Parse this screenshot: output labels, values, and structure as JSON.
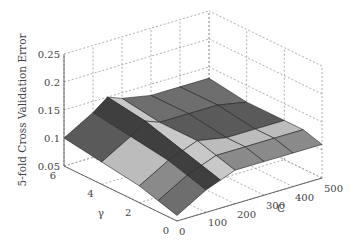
{
  "chart_data": {
    "type": "surface3d",
    "title": "",
    "xlabel": "C",
    "ylabel": "γ",
    "zlabel": "5-fold Cross Validation Error",
    "x_ticks": [
      "0",
      "100",
      "200",
      "300",
      "400",
      "500"
    ],
    "y_ticks": [
      "0",
      "2",
      "4",
      "6"
    ],
    "z_ticks": [
      "0.05",
      "0.1",
      "0.15",
      "0.2",
      "0.25"
    ],
    "xlim": [
      0,
      500
    ],
    "ylim": [
      0,
      6
    ],
    "zlim": [
      0.05,
      0.25
    ],
    "grid": true,
    "legend": null,
    "colormap": "grayscale",
    "surface": {
      "C": [
        0,
        100,
        150,
        200,
        300,
        400,
        500
      ],
      "gamma": [
        0,
        1,
        2,
        4,
        6
      ],
      "error": [
        [
          0.06,
          0.07,
          0.08,
          0.09,
          0.1
        ],
        [
          0.09,
          0.1,
          0.11,
          0.12,
          0.13
        ],
        [
          0.1,
          0.11,
          0.12,
          0.14,
          0.15
        ],
        [
          0.11,
          0.12,
          0.13,
          0.13,
          0.14
        ],
        [
          0.11,
          0.12,
          0.12,
          0.13,
          0.13
        ],
        [
          0.11,
          0.12,
          0.12,
          0.13,
          0.13
        ],
        [
          0.11,
          0.12,
          0.12,
          0.12,
          0.13
        ]
      ],
      "notes": "Approximate values read from 3D rendering; error ranges ~0.06-0.15, min near C=100, small gamma"
    }
  }
}
